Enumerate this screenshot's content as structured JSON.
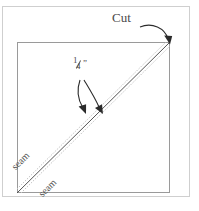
{
  "diagram": {
    "labels": {
      "cut": "Cut",
      "fraction_numerator": "1",
      "fraction_denominator": "4",
      "inch_mark": "”",
      "seam_upper": "seam",
      "seam_lower": "seam"
    },
    "colors": {
      "outer_border": "#cfcfcf",
      "square_border": "#9a9a9a",
      "solid_diagonal": "#555555",
      "dotted_diagonal": "#c2c2c2",
      "arrow": "#2b2b2b",
      "text": "#4a4a4a",
      "background": "#ffffff"
    },
    "geometry": {
      "outer_border_rect": [
        2,
        6,
        188,
        191
      ],
      "square_rect": [
        17,
        42,
        153,
        151
      ],
      "diagonal_start": [
        17,
        193
      ],
      "diagonal_end": [
        170,
        42
      ],
      "diagonal_offset_px": 5
    },
    "annotations": {
      "cut_arrow_target": "top-right-corner",
      "fraction_arrow_target": "seam-allowance-gap",
      "seam_line_count": 3
    }
  }
}
